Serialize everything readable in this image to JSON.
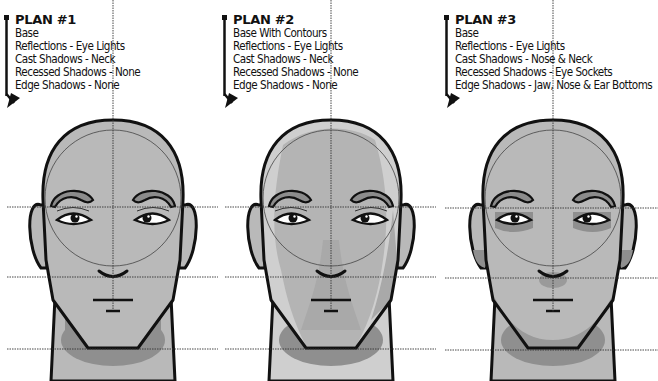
{
  "plans": [
    {
      "title": "PLAN #1",
      "items": [
        "Base",
        "Reflections - Eye Lights",
        "Cast Shadows - Neck",
        "Recessed Shadows - None",
        "Edge Shadows - None"
      ]
    },
    {
      "title": "PLAN #2",
      "items": [
        "Base With Contours",
        "Reflections - Eye Lights",
        "Cast Shadows - Neck",
        "Recessed Shadows - None",
        "Edge Shadows - None"
      ]
    },
    {
      "title": "PLAN #3",
      "items": [
        "Base",
        "Reflections - Eye Lights",
        "Cast Shadows - Nose & Neck",
        "Recessed Shadows - Eye Sockets",
        "Edge Shadows - Jaw, Nose & Ear Bottoms"
      ]
    }
  ],
  "colors": {
    "base_skin": "#b9b9b9",
    "light_contour": "#cfcfcf",
    "shadow": "#8f8f8f",
    "brow": "#8c8c8c",
    "outline": "#111111",
    "guide": "#333333"
  }
}
